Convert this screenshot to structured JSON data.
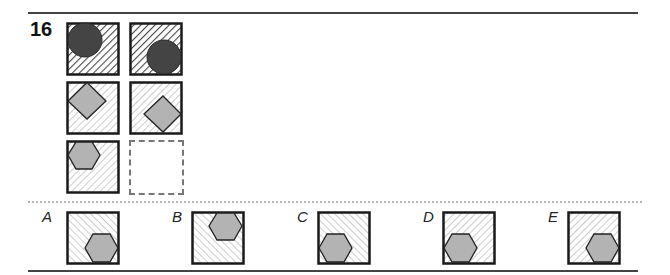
{
  "question": {
    "number": "16"
  },
  "colors": {
    "border": "#1a1a1a",
    "circle_fill": "#444444",
    "shape_fill": "#b3b3b3",
    "hatch_dark": "#555555",
    "hatch_light": "#bbbbbb"
  },
  "grid": [
    {
      "row": 1,
      "col": 1,
      "shape": "circle",
      "position": "top-left",
      "hatch": "dense-backslash"
    },
    {
      "row": 1,
      "col": 2,
      "shape": "circle",
      "position": "bottom-right",
      "hatch": "dense-backslash"
    },
    {
      "row": 2,
      "col": 1,
      "shape": "diamond",
      "position": "top-left",
      "hatch": "light-backslash"
    },
    {
      "row": 2,
      "col": 2,
      "shape": "diamond",
      "position": "bottom-right",
      "hatch": "light-backslash"
    },
    {
      "row": 3,
      "col": 1,
      "shape": "hexagon",
      "position": "top-left",
      "hatch": "light-backslash"
    },
    {
      "row": 3,
      "col": 2,
      "shape": "missing",
      "position": "",
      "hatch": "none"
    }
  ],
  "options": [
    {
      "label": "A",
      "shape": "hexagon",
      "position": "bottom-right",
      "hatch": "slash"
    },
    {
      "label": "B",
      "shape": "hexagon",
      "position": "top-right",
      "hatch": "slash"
    },
    {
      "label": "C",
      "shape": "hexagon",
      "position": "bottom-left",
      "hatch": "slash"
    },
    {
      "label": "D",
      "shape": "hexagon",
      "position": "bottom-left",
      "hatch": "backslash"
    },
    {
      "label": "E",
      "shape": "hexagon",
      "position": "bottom-right",
      "hatch": "backslash"
    }
  ]
}
